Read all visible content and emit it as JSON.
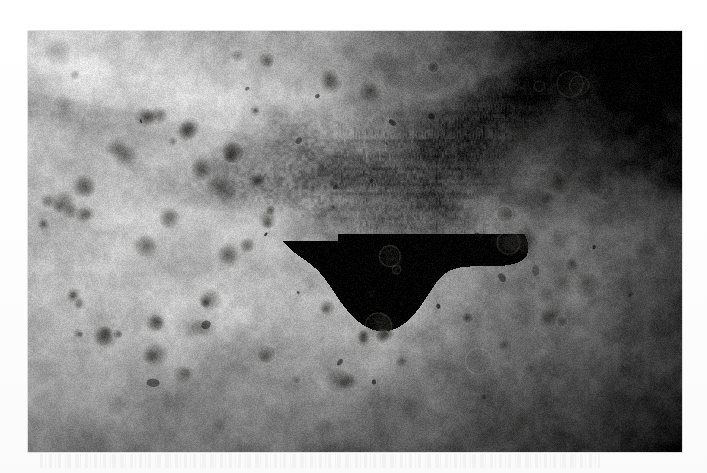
{
  "page": {
    "background_color": "#ffffff",
    "width": 707,
    "height": 473,
    "caption_text": ""
  },
  "photograph": {
    "title": "Clinical photograph of skin lesions",
    "modality": "black-and-white clinical photograph",
    "frame": {
      "x": 28,
      "y": 31,
      "width": 654,
      "height": 421
    },
    "alt_text": "Grayscale close-up photograph of skin showing a dark confluent central plaque surrounded by numerous discrete rounded papules scattered outward over the surrounding skin.",
    "tones": {
      "skin_base": "#b4b2ad",
      "skin_highlight": "#d8d6d1",
      "lesion_mid": "#7a7873",
      "lesion_dark": "#4a4845",
      "plaque_core": "#2e2d2b",
      "vignette_dark": "#1d1c1b"
    },
    "regions": [
      {
        "name": "upper-light-skin-fold",
        "description": "smooth pale band of skin across the upper left, curving down toward the right"
      },
      {
        "name": "central-confluent-plaque",
        "description": "dense dark irregular confluent plaque near the centre of the field",
        "center_x": 352,
        "center_y": 150,
        "radius_x": 118,
        "radius_y": 72
      },
      {
        "name": "satellite-papules",
        "description": "scattered discrete rounded dark papules radiating outward from the central plaque"
      },
      {
        "name": "right-vignette",
        "description": "progressive darkening of the image toward the right and upper-right margins"
      },
      {
        "name": "lower-shadow-band",
        "description": "broad darker shadow across the lower third of the photograph"
      }
    ],
    "lesions": {
      "count_rendered": 150,
      "description": "discrete rounded hyperpigmented papules, largest and most numerous adjacent to the central plaque, becoming sparser peripherally"
    }
  }
}
